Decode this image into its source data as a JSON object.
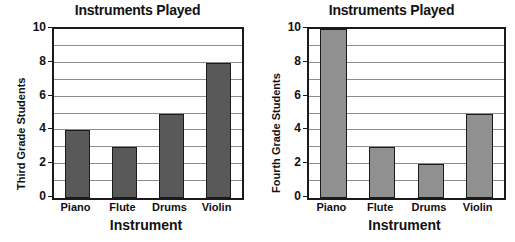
{
  "charts": [
    {
      "id": "third-grade",
      "title": "Instruments Played",
      "ylabel": "Third Grade Students",
      "xlabel": "Instrument",
      "bar_color": "#595959",
      "categories": [
        "Piano",
        "Flute",
        "Drums",
        "Violin"
      ],
      "values": [
        4,
        3,
        5,
        8
      ],
      "yticks": [
        "0",
        "2",
        "4",
        "6",
        "8",
        "10"
      ]
    },
    {
      "id": "fourth-grade",
      "title": "Instruments Played",
      "ylabel": "Fourth Grade Students",
      "xlabel": "Instrument",
      "bar_color": "#909090",
      "categories": [
        "Piano",
        "Flute",
        "Drums",
        "Violin"
      ],
      "values": [
        10,
        3,
        2,
        5
      ],
      "yticks": [
        "0",
        "2",
        "4",
        "6",
        "8",
        "10"
      ]
    }
  ],
  "chart_data": [
    {
      "type": "bar",
      "title": "Instruments Played",
      "xlabel": "Instrument",
      "ylabel": "Third Grade Students",
      "categories": [
        "Piano",
        "Flute",
        "Drums",
        "Violin"
      ],
      "values": [
        4,
        3,
        5,
        8
      ],
      "ylim": [
        0,
        10
      ],
      "ytick_labels": [
        "0",
        "2",
        "4",
        "6",
        "8",
        "10"
      ],
      "ytick_step": 2,
      "gridline_step": 1,
      "grid": true,
      "legend": "none",
      "bar_color": "#595959",
      "bar_edge_color": "#1a1a1a"
    },
    {
      "type": "bar",
      "title": "Instruments Played",
      "xlabel": "Instrument",
      "ylabel": "Fourth Grade Students",
      "categories": [
        "Piano",
        "Flute",
        "Drums",
        "Violin"
      ],
      "values": [
        10,
        3,
        2,
        5
      ],
      "ylim": [
        0,
        10
      ],
      "ytick_labels": [
        "0",
        "2",
        "4",
        "6",
        "8",
        "10"
      ],
      "ytick_step": 2,
      "gridline_step": 1,
      "grid": true,
      "legend": "none",
      "bar_color": "#909090",
      "bar_edge_color": "#1a1a1a"
    }
  ]
}
